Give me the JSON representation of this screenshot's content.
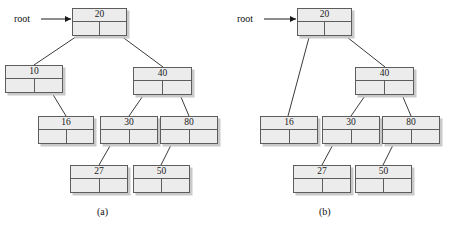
{
  "figure": {
    "panels": [
      {
        "id": "a",
        "caption": "(a)",
        "caption_pos": {
          "x": 97,
          "y": 207
        },
        "root_label": {
          "text": "root",
          "x": 14,
          "y": 14
        },
        "root_arrow": {
          "x1": 41,
          "y1": 19,
          "x2": 71,
          "y2": 19
        },
        "nodes": [
          {
            "name": "node-20",
            "value": "20",
            "x": 72,
            "y": 8,
            "w": 55,
            "h": 28
          },
          {
            "name": "node-10",
            "value": "10",
            "x": 5,
            "y": 65,
            "w": 58,
            "h": 28
          },
          {
            "name": "node-40",
            "value": "40",
            "x": 133,
            "y": 67,
            "w": 59,
            "h": 28
          },
          {
            "name": "node-16",
            "value": "16",
            "x": 38,
            "y": 116,
            "w": 56,
            "h": 28
          },
          {
            "name": "node-30",
            "value": "30",
            "x": 100,
            "y": 116,
            "w": 58,
            "h": 28
          },
          {
            "name": "node-80",
            "value": "80",
            "x": 160,
            "y": 116,
            "w": 58,
            "h": 28
          },
          {
            "name": "node-27",
            "value": "27",
            "x": 70,
            "y": 165,
            "w": 58,
            "h": 28
          },
          {
            "name": "node-50",
            "value": "50",
            "x": 133,
            "y": 165,
            "w": 57,
            "h": 28
          }
        ],
        "links": [
          {
            "name": "link-20-left-to-10",
            "x1": 86,
            "y1": 30,
            "x2": 34,
            "y2": 65
          },
          {
            "name": "link-20-right-to-40",
            "x1": 113,
            "y1": 30,
            "x2": 163,
            "y2": 67
          },
          {
            "name": "link-10-right-to-16",
            "x1": 49,
            "y1": 88,
            "x2": 66,
            "y2": 116
          },
          {
            "name": "link-40-left-to-30",
            "x1": 147,
            "y1": 90,
            "x2": 129,
            "y2": 116
          },
          {
            "name": "link-40-right-to-80",
            "x1": 178,
            "y1": 90,
            "x2": 189,
            "y2": 116
          },
          {
            "name": "link-30-left-to-27",
            "x1": 114,
            "y1": 139,
            "x2": 99,
            "y2": 165
          },
          {
            "name": "link-80-left-to-50",
            "x1": 174,
            "y1": 139,
            "x2": 161,
            "y2": 165
          }
        ]
      },
      {
        "id": "b",
        "caption": "(b)",
        "caption_pos": {
          "x": 319,
          "y": 207
        },
        "root_label": {
          "text": "root",
          "x": 237,
          "y": 14
        },
        "root_arrow": {
          "x1": 264,
          "y1": 19,
          "x2": 296,
          "y2": 19
        },
        "nodes": [
          {
            "name": "node-20",
            "value": "20",
            "x": 297,
            "y": 8,
            "w": 55,
            "h": 28
          },
          {
            "name": "node-40",
            "value": "40",
            "x": 355,
            "y": 67,
            "w": 59,
            "h": 28
          },
          {
            "name": "node-16",
            "value": "16",
            "x": 260,
            "y": 116,
            "w": 58,
            "h": 28
          },
          {
            "name": "node-30",
            "value": "30",
            "x": 322,
            "y": 116,
            "w": 58,
            "h": 28
          },
          {
            "name": "node-80",
            "value": "80",
            "x": 382,
            "y": 116,
            "w": 58,
            "h": 28
          },
          {
            "name": "node-27",
            "value": "27",
            "x": 293,
            "y": 165,
            "w": 58,
            "h": 28
          },
          {
            "name": "node-50",
            "value": "50",
            "x": 355,
            "y": 165,
            "w": 57,
            "h": 28
          }
        ],
        "links": [
          {
            "name": "link-20-left-to-16",
            "x1": 311,
            "y1": 30,
            "x2": 288,
            "y2": 116
          },
          {
            "name": "link-20-right-to-40",
            "x1": 338,
            "y1": 30,
            "x2": 385,
            "y2": 67
          },
          {
            "name": "link-40-left-to-30",
            "x1": 369,
            "y1": 90,
            "x2": 351,
            "y2": 116
          },
          {
            "name": "link-40-right-to-80",
            "x1": 400,
            "y1": 90,
            "x2": 411,
            "y2": 116
          },
          {
            "name": "link-30-left-to-27",
            "x1": 336,
            "y1": 139,
            "x2": 322,
            "y2": 165
          },
          {
            "name": "link-80-left-to-50",
            "x1": 396,
            "y1": 139,
            "x2": 383,
            "y2": 165
          }
        ]
      }
    ],
    "style": {
      "node_fill": "#ececec",
      "node_border": "#5d5d5d",
      "node_shadow": "#c9c9c9",
      "line_color": "#3a3a3a",
      "text_color": "#1a1a1a",
      "background": "#ffffff"
    }
  }
}
